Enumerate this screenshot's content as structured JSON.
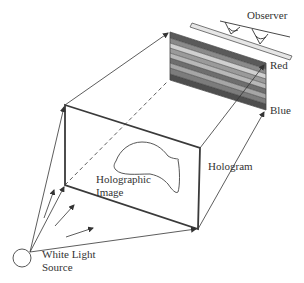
{
  "labels": {
    "observer": "Observer",
    "red": "Red",
    "blue": "Blue",
    "hologram": "Hologram",
    "holographic_line1": "Holographic",
    "holographic_line2": "Image",
    "source_line1": "White Light",
    "source_line2": "Source"
  },
  "colors": {
    "line": "#333333",
    "frame": "#3a3a3a",
    "observer_plate": "#e6e6e6",
    "stripes": [
      "#5a5a5a",
      "#8a8a8a",
      "#b4b4b4",
      "#d8d8d8",
      "#9a9a9a",
      "#6e6e6e",
      "#a6a6a6",
      "#7c7c7c",
      "#4e4e4e"
    ]
  },
  "icons": {
    "light_source": "circle-icon",
    "observer_eyes": "eye-icon"
  }
}
